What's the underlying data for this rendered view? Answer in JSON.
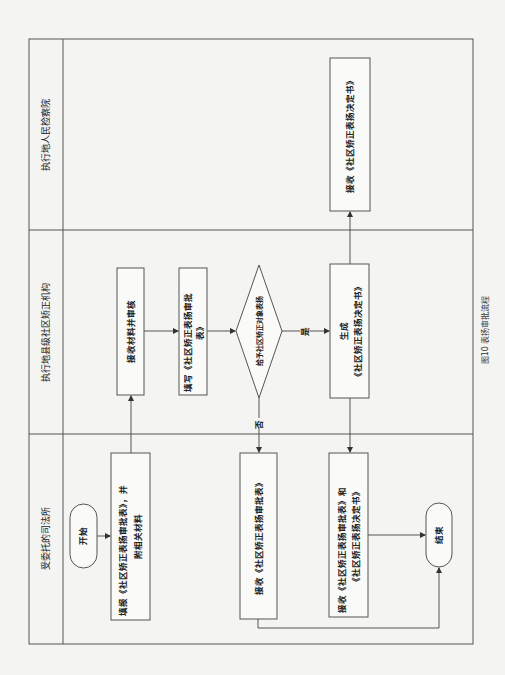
{
  "figure": {
    "caption": "图10 表扬审批流程",
    "line_color": "#555555",
    "background": "#f4f4f2"
  },
  "lanes": [
    {
      "label": "执行地人民检察院"
    },
    {
      "label": "执行地县级社区矫正机构"
    },
    {
      "label": "受委托的司法所"
    }
  ],
  "nodes": {
    "start": {
      "label": "开始"
    },
    "submit": {
      "line1": "填报《社区矫正表扬审批表》，并",
      "line2": "附相关材料"
    },
    "review": {
      "label": "接收材料并审核"
    },
    "fill": {
      "line1": "填写《社区矫正表扬审批",
      "line2": "表》"
    },
    "decision": {
      "label": "给予社区矫正对象表扬"
    },
    "generate": {
      "line1": "生成",
      "line2": "《社区矫正表扬决定书》"
    },
    "procuratorate_receive": {
      "label": "接收《社区矫正表扬决定书》"
    },
    "receive_form": {
      "label": "接收《社区矫正表扬审批表》"
    },
    "receive_both": {
      "line1": "接收《社区矫正表扬审批表》和",
      "line2": "《社区矫正表扬决定书》"
    },
    "end": {
      "label": "结束"
    }
  },
  "edges": {
    "yes": "是",
    "no": "否"
  }
}
